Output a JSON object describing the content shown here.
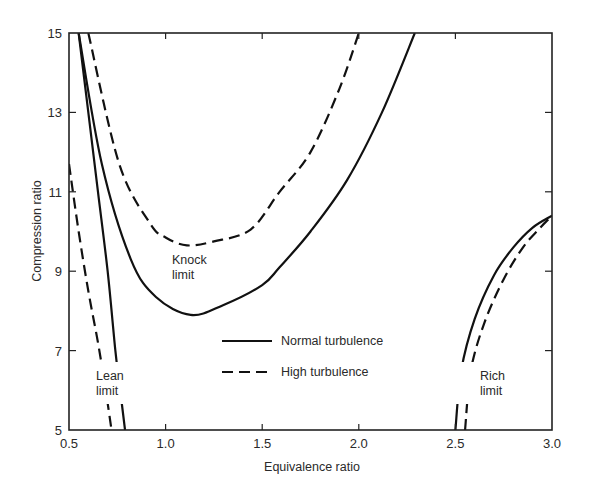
{
  "chart_data": {
    "type": "line",
    "title": "",
    "xlabel": "Equivalence ratio",
    "ylabel": "Compression ratio",
    "xlim": [
      0.5,
      3.0
    ],
    "ylim": [
      5,
      15
    ],
    "xticks": [
      0.5,
      1.0,
      1.5,
      2.0,
      2.5,
      3.0
    ],
    "xtick_labels": [
      "0.5",
      "1.0",
      "1.5",
      "2.0",
      "2.5",
      "3.0"
    ],
    "yticks": [
      5,
      7,
      9,
      11,
      13,
      15
    ],
    "ytick_labels": [
      "5",
      "7",
      "9",
      "11",
      "13",
      "15"
    ],
    "grid": false,
    "legend": {
      "position": "center-lower",
      "entries": [
        {
          "label": "Normal turbulence",
          "style": "solid"
        },
        {
          "label": "High turbulence",
          "style": "dashed"
        }
      ]
    },
    "annotations": [
      {
        "text": [
          "Knock",
          "limit"
        ],
        "x": 1.05,
        "y": 9.0
      },
      {
        "text": [
          "Lean",
          "limit"
        ],
        "x": 0.73,
        "y": 6.3
      },
      {
        "text": [
          "Rich",
          "limit"
        ],
        "x": 2.63,
        "y": 5.8
      }
    ],
    "series": [
      {
        "name": "Knock limit - Normal turbulence",
        "style": "solid",
        "x": [
          0.55,
          0.67,
          0.82,
          0.95,
          1.13,
          1.3,
          1.5,
          1.59,
          1.75,
          1.94,
          2.12,
          2.29
        ],
        "y": [
          15.0,
          11.7,
          9.3,
          8.35,
          7.9,
          8.15,
          8.65,
          9.1,
          10.0,
          11.3,
          13.0,
          15.0
        ]
      },
      {
        "name": "Knock limit - High turbulence",
        "style": "dashed",
        "x": [
          0.6,
          0.76,
          0.92,
          1.0,
          1.11,
          1.25,
          1.44,
          1.59,
          1.75,
          1.9,
          2.0
        ],
        "y": [
          15.0,
          11.7,
          10.2,
          9.85,
          9.65,
          9.75,
          10.05,
          11.0,
          12.0,
          13.6,
          15.0
        ]
      },
      {
        "name": "Lean limit - Normal turbulence",
        "style": "solid",
        "x": [
          0.55,
          0.6,
          0.65,
          0.7,
          0.74,
          0.76,
          0.79
        ],
        "y": [
          15.0,
          13.0,
          11.0,
          9.0,
          7.0,
          6.2,
          5.0
        ]
      },
      {
        "name": "Lean limit - High turbulence",
        "style": "dashed",
        "x": [
          0.5,
          0.55,
          0.6,
          0.65,
          0.69,
          0.72
        ],
        "y": [
          11.7,
          10.0,
          8.5,
          7.2,
          6.0,
          5.0
        ]
      },
      {
        "name": "Rich limit - Normal turbulence",
        "style": "solid",
        "x": [
          2.5,
          2.53,
          2.6,
          2.7,
          2.8,
          2.9,
          3.0
        ],
        "y": [
          5.0,
          6.5,
          7.8,
          8.9,
          9.6,
          10.1,
          10.4
        ]
      },
      {
        "name": "Rich limit - High turbulence",
        "style": "dashed",
        "x": [
          2.55,
          2.58,
          2.65,
          2.75,
          2.85,
          2.93,
          3.0
        ],
        "y": [
          5.0,
          6.5,
          7.7,
          8.8,
          9.6,
          10.05,
          10.4
        ]
      }
    ]
  }
}
